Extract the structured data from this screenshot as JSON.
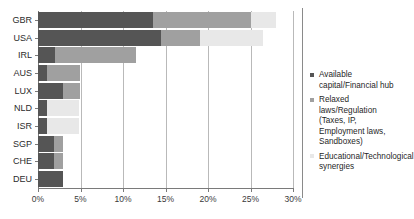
{
  "chart_data": {
    "type": "bar",
    "orientation": "horizontal",
    "stacked": true,
    "title": "",
    "xlabel": "",
    "ylabel": "",
    "xlim": [
      0,
      30
    ],
    "grid": true,
    "legend_position": "right",
    "categories": [
      "GBR",
      "USA",
      "IRL",
      "AUS",
      "LUX",
      "NLD",
      "ISR",
      "SGP",
      "CHE",
      "DEU"
    ],
    "tick_labels": [
      "0%",
      "5%",
      "10%",
      "15%",
      "20%",
      "25%",
      "30%"
    ],
    "tick_values": [
      0,
      5,
      10,
      15,
      20,
      25,
      30
    ],
    "series": [
      {
        "name": "Available capital/Financial hub",
        "color": "#555555",
        "values": [
          13.5,
          14.5,
          2.0,
          1.0,
          2.9,
          1.0,
          1.0,
          1.9,
          1.9,
          2.9
        ]
      },
      {
        "name": "Relaxed laws/Regulation (Taxes, IP, Employment laws, Sandboxes)",
        "color": "#a0a0a0",
        "values": [
          11.5,
          4.5,
          9.5,
          3.9,
          2.0,
          0.0,
          0.0,
          1.0,
          1.0,
          0.0
        ]
      },
      {
        "name": "Educational/Technological synergies",
        "color": "#e8e8e8",
        "values": [
          3.0,
          7.5,
          0.0,
          0.0,
          0.0,
          3.8,
          3.8,
          0.0,
          0.0,
          0.0
        ]
      }
    ],
    "totals": [
      28.0,
      26.5,
      11.5,
      4.9,
      4.9,
      4.8,
      4.8,
      2.9,
      2.9,
      2.9
    ]
  },
  "legend": {
    "items": [
      {
        "label": "Available capital/Financial hub",
        "color": "#555555"
      },
      {
        "label": "Relaxed laws/Regulation (Taxes, IP, Employment laws, Sandboxes)",
        "color": "#a0a0a0"
      },
      {
        "label": "Educational/Technological synergies",
        "color": "#e8e8e8"
      }
    ]
  }
}
